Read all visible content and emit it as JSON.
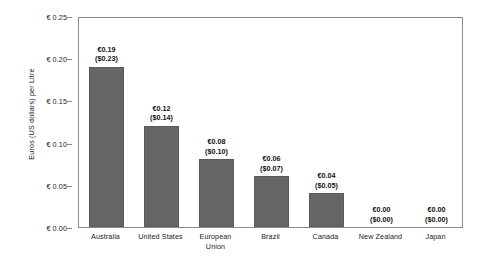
{
  "chart_data": {
    "type": "bar",
    "title": "",
    "subtitle": "",
    "xlabel": "",
    "ylabel": "Euros (US dollars) per Litre",
    "ylim": [
      0,
      0.25
    ],
    "ytick_values": [
      0.25,
      0.2,
      0.15,
      0.1,
      0.05,
      0.0
    ],
    "ytick_labels": [
      "€ 0.25",
      "€ 0.20",
      "€ 0.15",
      "€ 0.10",
      "€ 0.05",
      "€ 0.00"
    ],
    "grid": false,
    "legend": "none",
    "bar_color": "#666666",
    "frame_color": "#8c8c8c",
    "background": "#ffffff",
    "categories": [
      "Australia",
      "United States",
      "European Union",
      "Brazil",
      "Canada",
      "New Zealand",
      "Japan"
    ],
    "category_label_lines": [
      [
        "Australia"
      ],
      [
        "United States"
      ],
      [
        "European",
        "Union"
      ],
      [
        "Brazil"
      ],
      [
        "Canada"
      ],
      [
        "New Zealand"
      ],
      [
        "Japan"
      ]
    ],
    "values": [
      0.19,
      0.12,
      0.08,
      0.06,
      0.04,
      0.0,
      0.0
    ],
    "usd_values": [
      0.23,
      0.14,
      0.1,
      0.07,
      0.05,
      0.0,
      0.0
    ],
    "data_labels": [
      {
        "euro": "€0.19",
        "usd": "($0.23)"
      },
      {
        "euro": "€0.12",
        "usd": "($0.14)"
      },
      {
        "euro": "€0.08",
        "usd": "($0.10)"
      },
      {
        "euro": "€0.06",
        "usd": "($0.07)"
      },
      {
        "euro": "€0.04",
        "usd": "($0.05)"
      },
      {
        "euro": "€0.00",
        "usd": "($0.00)"
      },
      {
        "euro": "€0.00",
        "usd": "($0.00)"
      }
    ]
  }
}
